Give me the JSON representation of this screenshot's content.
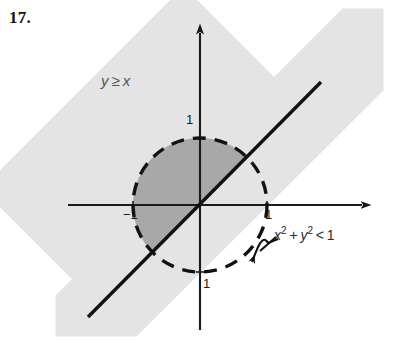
{
  "exercise": {
    "number": "17."
  },
  "figure": {
    "type": "cartesian-region-diagram",
    "colors": {
      "band_fill": "#e4e4e4",
      "overlap_fill": "#a8a8a8",
      "axis": "#1a1a1a",
      "curve": "#111111",
      "label_gray": "#545454"
    },
    "axes": {
      "origin": {
        "x": 200,
        "y": 205
      },
      "x_axis": {
        "start_x": 68,
        "end_x": 368,
        "arrow": "right"
      },
      "y_axis": {
        "start_y": 330,
        "end_y": 26,
        "arrow": "up"
      }
    },
    "circle": {
      "center": {
        "x": 200,
        "y": 205
      },
      "radius": 67,
      "style": "dashed",
      "meaning": "strict-inequality-boundary"
    },
    "line": {
      "equation": "y = x",
      "style": "solid",
      "from": {
        "x": 88,
        "y": 317
      },
      "to": {
        "x": 321,
        "y": 82
      }
    },
    "band": {
      "description": "half-plane strip shaded for y greater-or-equal x",
      "rotation_deg": -45
    }
  },
  "labels": {
    "inequality_half_plane": {
      "variable_y": "y",
      "relation": "≥",
      "variable_x": "x"
    },
    "circle_inequality": {
      "term_x": "x",
      "exp_x": "2",
      "plus": "+",
      "term_y": "y",
      "exp_y": "2",
      "relation": "<",
      "value": "1"
    },
    "ticks": {
      "y_top": "1",
      "x_negative_one": "−1",
      "x_positive_one": "1",
      "y_bottom": "1"
    }
  }
}
